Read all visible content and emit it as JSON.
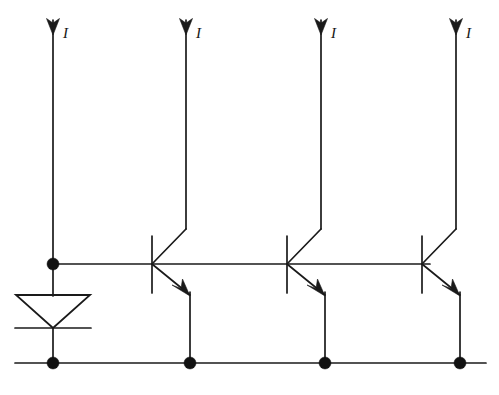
{
  "diagram": {
    "type": "circuit-schematic",
    "ink_color": "#1a1a1a",
    "background_color": "#ffffff",
    "canvas": {
      "width": 499,
      "height": 395
    }
  },
  "labels": {
    "current_1": "I",
    "current_2": "I",
    "current_3": "I",
    "current_4": "I"
  },
  "branches": [
    {
      "name": "reference-branch",
      "label": "I",
      "label_x": 63,
      "label_y": 26,
      "x": 53,
      "top_y": 18,
      "device": "diode"
    },
    {
      "name": "output-branch-1",
      "label": "I",
      "label_x": 196,
      "label_y": 26,
      "x": 186,
      "top_y": 18,
      "device": "transistor"
    },
    {
      "name": "output-branch-2",
      "label": "I",
      "label_x": 331,
      "label_y": 26,
      "x": 321,
      "top_y": 18,
      "device": "transistor"
    },
    {
      "name": "output-branch-3",
      "label": "I",
      "label_x": 466,
      "label_y": 26,
      "x": 456,
      "top_y": 18,
      "device": "transistor"
    }
  ],
  "transistors": [
    {
      "name": "transistor-q1",
      "base_x": 152,
      "base_y": 264,
      "collector_x": 186,
      "emitter_x": 190
    },
    {
      "name": "transistor-q2",
      "base_x": 287,
      "base_y": 264,
      "collector_x": 321,
      "emitter_x": 325
    },
    {
      "name": "transistor-q3",
      "base_x": 422,
      "base_y": 264,
      "collector_x": 456,
      "emitter_x": 460
    }
  ],
  "diode": {
    "name": "reference-diode",
    "orientation": "cathode-down",
    "anode_y": 295,
    "cathode_y": 328,
    "left_x": 16,
    "right_x": 90,
    "center_x": 53
  },
  "rails": {
    "base_rail": {
      "name": "base-rail",
      "y": 264,
      "x_start": 53,
      "x_end": 430
    },
    "ground_rail": {
      "name": "ground-rail",
      "y": 363,
      "x_start": 15,
      "x_end": 486
    }
  },
  "nodes": [
    {
      "name": "node-reference-base",
      "x": 53,
      "y": 264,
      "radius": 6
    },
    {
      "name": "node-reference-ground",
      "x": 53,
      "y": 363,
      "radius": 6
    },
    {
      "name": "node-emitter-1-ground",
      "x": 190,
      "y": 363,
      "radius": 6
    },
    {
      "name": "node-emitter-2-ground",
      "x": 325,
      "y": 363,
      "radius": 6
    },
    {
      "name": "node-emitter-3-ground",
      "x": 460,
      "y": 363,
      "radius": 6
    }
  ]
}
